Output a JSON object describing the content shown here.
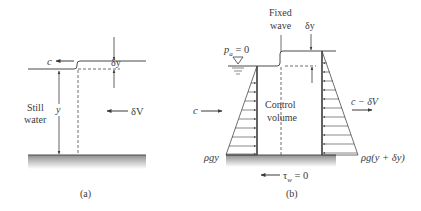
{
  "colors": {
    "line": "#4a4a4a",
    "text": "#3a3a3a",
    "ground_top": "#9a9a9a",
    "ground_bottom": "#ffffff"
  },
  "panel_a": {
    "caption": "(a)",
    "wave_speed_label": "c",
    "wave_height_label": "δy",
    "depth_label": "y",
    "still_water_line1": "Still",
    "still_water_line2": "water",
    "velocity_label": "δV"
  },
  "panel_b": {
    "caption": "(b)",
    "fixed_wave_line1": "Fixed",
    "fixed_wave_line2": "wave",
    "wave_height_label": "δy",
    "atmospheric_p": "p",
    "atmospheric_sub": "a",
    "atmospheric_eq": " = 0",
    "inflow_label": "c",
    "outflow_label": "c − δV",
    "control_volume_line1": "Control",
    "control_volume_line2": "volume",
    "left_pressure_label": "ρgy",
    "right_pressure_label": "ρg(y + δy)",
    "wall_shear_tau": "τ",
    "wall_shear_sub": "w",
    "wall_shear_eq": " = 0"
  }
}
